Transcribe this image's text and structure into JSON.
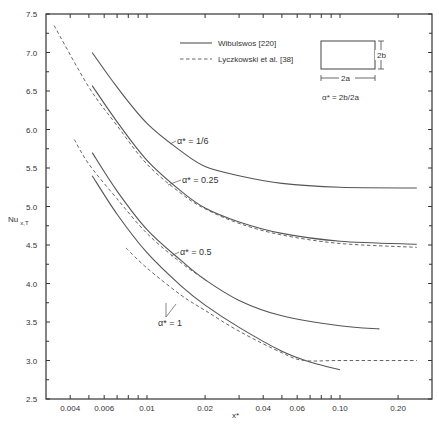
{
  "chart_data": {
    "type": "line",
    "title": "",
    "xlabel": "x*",
    "ylabel": "Nu x,T",
    "xscale": "log",
    "xlim": [
      0.0033,
      0.3
    ],
    "ylim": [
      2.5,
      7.5
    ],
    "x_tick_labels": [
      "0.004",
      "0.006",
      "0.01",
      "0.02",
      "0.04",
      "0.06",
      "0.10",
      "0.20"
    ],
    "y_tick_labels": [
      "2.5",
      "3.0",
      "3.5",
      "4.0",
      "4.5",
      "5.0",
      "5.5",
      "6.0",
      "6.5",
      "7.0",
      "7.5"
    ],
    "grid": false,
    "legend": [
      {
        "label": "Wibulswos [220]",
        "style": "solid"
      },
      {
        "label": "Lyczkowski et al. [38]",
        "style": "dashed"
      }
    ],
    "inset": {
      "width_label": "2a",
      "height_label": "2b",
      "definition": "α* = 2b/2a"
    },
    "annotations": [
      "α* = 1/6",
      "α* = 0.25",
      "α* = 0.5",
      "α* = 1"
    ],
    "series": [
      {
        "name": "Wibulswos α*=1/6",
        "style": "solid",
        "x": [
          0.0052,
          0.007,
          0.01,
          0.015,
          0.02,
          0.03,
          0.05,
          0.1,
          0.25
        ],
        "y": [
          7.0,
          6.55,
          6.08,
          5.72,
          5.52,
          5.4,
          5.3,
          5.25,
          5.24
        ]
      },
      {
        "name": "Wibulswos α*=0.25",
        "style": "solid",
        "x": [
          0.0052,
          0.007,
          0.01,
          0.015,
          0.02,
          0.03,
          0.05,
          0.1,
          0.25
        ],
        "y": [
          6.57,
          6.1,
          5.6,
          5.2,
          4.98,
          4.8,
          4.65,
          4.55,
          4.51
        ]
      },
      {
        "name": "Lyczkowski α*=0.25",
        "style": "dashed",
        "x": [
          0.0033,
          0.005,
          0.007,
          0.01,
          0.015,
          0.02,
          0.03,
          0.05,
          0.1,
          0.25
        ],
        "y": [
          7.35,
          6.55,
          6.05,
          5.55,
          5.17,
          4.97,
          4.78,
          4.63,
          4.52,
          4.47
        ]
      },
      {
        "name": "Wibulswos α*=0.5",
        "style": "solid",
        "x": [
          0.0052,
          0.007,
          0.01,
          0.015,
          0.02,
          0.03,
          0.05,
          0.1,
          0.16
        ],
        "y": [
          5.7,
          5.2,
          4.7,
          4.3,
          4.05,
          3.78,
          3.58,
          3.45,
          3.41
        ]
      },
      {
        "name": "Lyczkowski α*=0.5",
        "style": "dashed",
        "x": [
          0.0042,
          0.005,
          0.007,
          0.01,
          0.015,
          0.02
        ],
        "y": [
          5.87,
          5.55,
          5.1,
          4.65,
          4.27,
          4.05
        ]
      },
      {
        "name": "Wibulswos α*=1",
        "style": "solid",
        "x": [
          0.0052,
          0.007,
          0.01,
          0.015,
          0.02,
          0.03,
          0.05,
          0.07,
          0.1
        ],
        "y": [
          5.4,
          4.9,
          4.4,
          3.97,
          3.72,
          3.43,
          3.12,
          2.98,
          2.88
        ]
      },
      {
        "name": "Lyczkowski α*=1",
        "style": "dashed",
        "x": [
          0.0078,
          0.01,
          0.015,
          0.02,
          0.03,
          0.05,
          0.065,
          0.1,
          0.25
        ],
        "y": [
          4.46,
          4.2,
          3.85,
          3.65,
          3.38,
          3.1,
          3.0,
          3.0,
          3.0
        ]
      }
    ]
  },
  "axis": {
    "y_title_main": "Nu",
    "y_title_sub": "x,T",
    "x_title": "x*"
  },
  "legend_items": {
    "solid_label": "Wibulswos [220]",
    "dashed_label": "Lyczkowski  et  al. [38]"
  },
  "inset": {
    "width_label": "2a",
    "height_label": "2b",
    "formula": "α* = 2b/2a"
  },
  "labels": {
    "a16": "α* = 1/6",
    "a025": "α* = 0.25",
    "a05": "α* = 0.5",
    "a1": "α* = 1"
  },
  "ticks": {
    "x": [
      "0.004",
      "0.006",
      "0.01",
      "0.02",
      "0.04",
      "0.06",
      "0.10",
      "0.20"
    ],
    "y": [
      "2.5",
      "3.0",
      "3.5",
      "4.0",
      "4.5",
      "5.0",
      "5.5",
      "6.0",
      "6.5",
      "7.0",
      "7.5"
    ]
  }
}
